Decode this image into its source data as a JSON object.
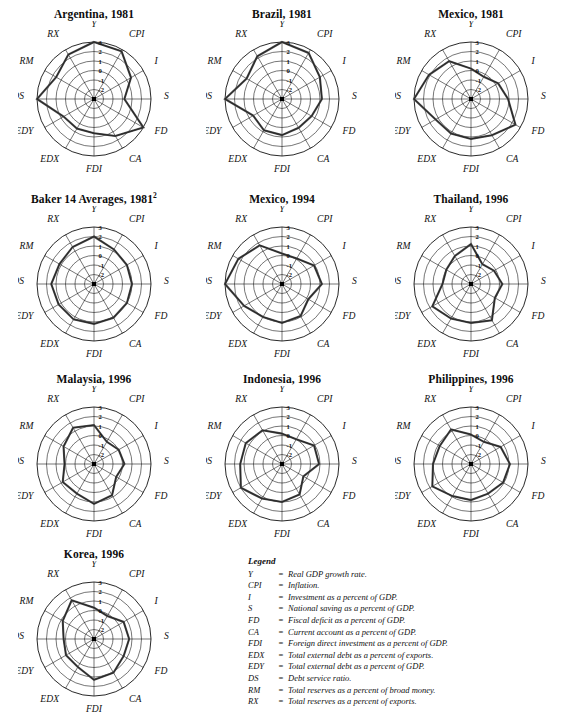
{
  "axes": [
    "Y",
    "CPI",
    "I",
    "S",
    "FD",
    "CA",
    "FDI",
    "EDX",
    "EDY",
    "DS",
    "RM",
    "RX"
  ],
  "ticks": [
    "3",
    "2",
    "1",
    "0",
    "-1",
    "-2"
  ],
  "scale": {
    "min": -3,
    "max": 3,
    "rings": 6
  },
  "colors": {
    "grid": "#1a1a1a",
    "data": "#4a4a4a",
    "text": "#111111"
  },
  "legend": {
    "title": "Legend",
    "entries": [
      {
        "abbr": "Y",
        "eq": "=",
        "desc": "Real GDP growth rate."
      },
      {
        "abbr": "CPI",
        "eq": "=",
        "desc": "Inflation."
      },
      {
        "abbr": "I",
        "eq": "=",
        "desc": "Investment as a percent of GDP."
      },
      {
        "abbr": "S",
        "eq": "=",
        "desc": "National saving as a percent of GDP."
      },
      {
        "abbr": "FD",
        "eq": "=",
        "desc": "Fiscal deficit as a percent of GDP."
      },
      {
        "abbr": "CA",
        "eq": "=",
        "desc": "Current account as a percent of GDP."
      },
      {
        "abbr": "FDI",
        "eq": "=",
        "desc": "Foreign direct investment as a percent of GDP."
      },
      {
        "abbr": "EDX",
        "eq": "=",
        "desc": "Total external debt as a percent of exports."
      },
      {
        "abbr": "EDY",
        "eq": "=",
        "desc": "Total external debt as a percent of GDP."
      },
      {
        "abbr": "DS",
        "eq": "=",
        "desc": "Debt service ratio."
      },
      {
        "abbr": "RM",
        "eq": "=",
        "desc": "Total reserves as a percent of broad money."
      },
      {
        "abbr": "RX",
        "eq": "=",
        "desc": "Total reserves as a percent of exports."
      }
    ]
  },
  "chart_data": [
    {
      "type": "radar",
      "title": "Argentina, 1981",
      "title_sup": "",
      "categories": [
        "Y",
        "CPI",
        "I",
        "S",
        "FD",
        "CA",
        "FDI",
        "EDX",
        "EDY",
        "DS",
        "RM",
        "RX"
      ],
      "values": [
        3.0,
        2.8,
        1.5,
        0.2,
        3.0,
        1.5,
        0.6,
        0.6,
        0.7,
        3.0,
        1.6,
        2.4
      ],
      "ylim": [
        -3,
        3
      ],
      "xlabel": "",
      "ylabel": "",
      "grid": true,
      "legend": "none"
    },
    {
      "type": "radar",
      "title": "Brazil, 1981",
      "title_sup": "",
      "categories": [
        "Y",
        "CPI",
        "I",
        "S",
        "FD",
        "CA",
        "FDI",
        "EDX",
        "EDY",
        "DS",
        "RM",
        "RX"
      ],
      "values": [
        3.0,
        2.6,
        1.6,
        1.2,
        0.6,
        0.5,
        0.8,
        0.8,
        0.5,
        3.0,
        1.3,
        2.2
      ],
      "ylim": [
        -3,
        3
      ],
      "xlabel": "",
      "ylabel": "",
      "grid": true,
      "legend": "none"
    },
    {
      "type": "radar",
      "title": "Mexico, 1981",
      "title_sup": "",
      "categories": [
        "Y",
        "CPI",
        "I",
        "S",
        "FD",
        "CA",
        "FDI",
        "EDX",
        "EDY",
        "DS",
        "RM",
        "RX"
      ],
      "values": [
        0.2,
        -0.3,
        0.3,
        0.9,
        2.4,
        1.4,
        1.2,
        1.2,
        1.3,
        3.0,
        2.1,
        1.6
      ],
      "ylim": [
        -3,
        3
      ],
      "xlabel": "",
      "ylabel": "",
      "grid": true,
      "legend": "none"
    },
    {
      "type": "radar",
      "title": "Baker 14 Averages, 1981",
      "title_sup": "2",
      "categories": [
        "Y",
        "CPI",
        "I",
        "S",
        "FD",
        "CA",
        "FDI",
        "EDX",
        "EDY",
        "DS",
        "RM",
        "RX"
      ],
      "values": [
        2.0,
        1.2,
        1.0,
        1.0,
        1.0,
        1.1,
        1.2,
        1.3,
        1.3,
        1.5,
        1.2,
        1.5
      ],
      "ylim": [
        -3,
        3
      ],
      "xlabel": "",
      "ylabel": "",
      "grid": true,
      "legend": "none"
    },
    {
      "type": "radar",
      "title": "Mexico, 1994",
      "title_sup": "",
      "categories": [
        "Y",
        "CPI",
        "I",
        "S",
        "FD",
        "CA",
        "FDI",
        "EDX",
        "EDY",
        "DS",
        "RM",
        "RX"
      ],
      "values": [
        0.2,
        0.1,
        0.9,
        1.2,
        0.2,
        0.9,
        1.1,
        1.0,
        1.6,
        3.0,
        2.3,
        1.7
      ],
      "ylim": [
        -3,
        3
      ],
      "xlabel": "",
      "ylabel": "",
      "grid": true,
      "legend": "none"
    },
    {
      "type": "radar",
      "title": "Thailand, 1996",
      "title_sup": "",
      "categories": [
        "Y",
        "CPI",
        "I",
        "S",
        "FD",
        "CA",
        "FDI",
        "EDX",
        "EDY",
        "DS",
        "RM",
        "RX"
      ],
      "values": [
        1.2,
        -0.6,
        -0.2,
        0.3,
        -0.1,
        1.4,
        1.1,
        1.2,
        1.7,
        0.0,
        0.0,
        0.4
      ],
      "ylim": [
        -3,
        3
      ],
      "xlabel": "",
      "ylabel": "",
      "grid": true,
      "legend": "none"
    },
    {
      "type": "radar",
      "title": "Malaysia, 1996",
      "title_sup": "",
      "categories": [
        "Y",
        "CPI",
        "I",
        "S",
        "FD",
        "CA",
        "FDI",
        "EDX",
        "EDY",
        "DS",
        "RM",
        "RX"
      ],
      "values": [
        1.1,
        -0.3,
        0.0,
        0.2,
        -0.3,
        0.8,
        1.2,
        0.6,
        0.8,
        0.1,
        0.7,
        1.4
      ],
      "ylim": [
        -3,
        3
      ],
      "xlabel": "",
      "ylabel": "",
      "grid": true,
      "legend": "none"
    },
    {
      "type": "radar",
      "title": "Indonesia, 1996",
      "title_sup": "",
      "categories": [
        "Y",
        "CPI",
        "I",
        "S",
        "FD",
        "CA",
        "FDI",
        "EDX",
        "EDY",
        "DS",
        "RM",
        "RX"
      ],
      "values": [
        0.2,
        0.0,
        0.9,
        0.9,
        -0.4,
        0.7,
        1.0,
        1.2,
        2.0,
        1.4,
        1.4,
        1.1
      ],
      "ylim": [
        -3,
        3
      ],
      "xlabel": "",
      "ylabel": "",
      "grid": true,
      "legend": "none"
    },
    {
      "type": "radar",
      "title": "Philippines, 1996",
      "title_sup": "",
      "categories": [
        "Y",
        "CPI",
        "I",
        "S",
        "FD",
        "CA",
        "FDI",
        "EDX",
        "EDY",
        "DS",
        "RM",
        "RX"
      ],
      "values": [
        0.1,
        -0.3,
        0.6,
        1.1,
        0.9,
        0.6,
        0.8,
        0.9,
        1.7,
        1.0,
        0.8,
        1.2
      ],
      "ylim": [
        -3,
        3
      ],
      "xlabel": "",
      "ylabel": "",
      "grid": true,
      "legend": "none"
    },
    {
      "type": "radar",
      "title": "Korea, 1996",
      "title_sup": "",
      "categories": [
        "Y",
        "CPI",
        "I",
        "S",
        "FD",
        "CA",
        "FDI",
        "EDX",
        "EDY",
        "DS",
        "RM",
        "RX"
      ],
      "values": [
        0.3,
        -0.2,
        0.6,
        0.7,
        0.6,
        1.1,
        1.3,
        0.4,
        0.4,
        0.2,
        0.8,
        1.7
      ],
      "ylim": [
        -3,
        3
      ],
      "xlabel": "",
      "ylabel": "",
      "grid": true,
      "legend": "none"
    }
  ]
}
